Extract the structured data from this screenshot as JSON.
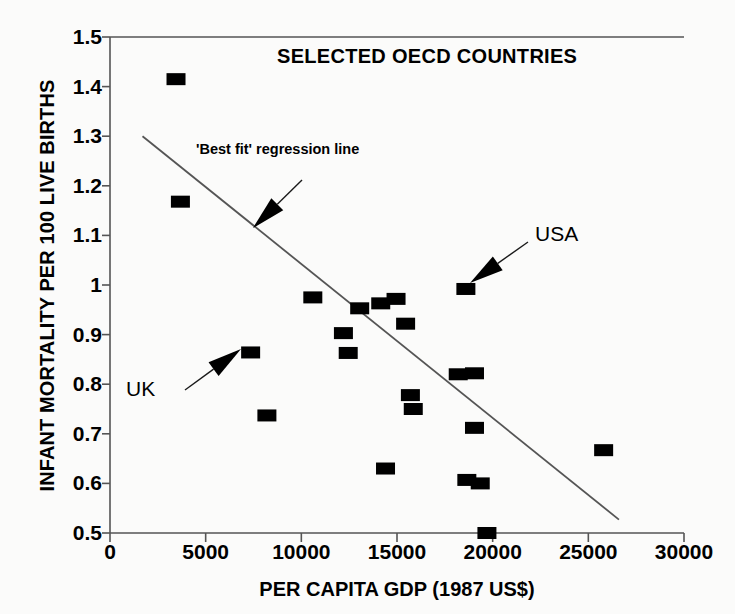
{
  "chart_data": {
    "type": "scatter",
    "title": "SELECTED OECD COUNTRIES",
    "xlabel": "PER CAPITA GDP (1987 US$)",
    "ylabel": "INFANT MORTALITY PER 100 LIVE BIRTHS",
    "xlim": [
      0,
      30000
    ],
    "ylim": [
      0.5,
      1.5
    ],
    "grid": false,
    "legend": "none",
    "xticks": [
      0,
      5000,
      10000,
      15000,
      20000,
      25000,
      30000
    ],
    "xtick_labels": [
      "0",
      "5000",
      "10000",
      "15000",
      "20000",
      "25000",
      "30000"
    ],
    "yticks": [
      0.5,
      0.6,
      0.7,
      0.8,
      0.9,
      1.0,
      1.1,
      1.2,
      1.3,
      1.4,
      1.5
    ],
    "ytick_labels": [
      "0.5",
      "0.6",
      "0.7",
      "0.8",
      "0.9",
      "1",
      "1.1",
      "1.2",
      "1.3",
      "1.4",
      "1.5"
    ],
    "marker": "filled-square",
    "marker_color": "#000000",
    "points": [
      {
        "x": 3450,
        "y": 1.415
      },
      {
        "x": 3680,
        "y": 1.168
      },
      {
        "x": 7350,
        "y": 0.864,
        "label": "UK"
      },
      {
        "x": 8200,
        "y": 0.737
      },
      {
        "x": 10600,
        "y": 0.975
      },
      {
        "x": 12200,
        "y": 0.903
      },
      {
        "x": 12450,
        "y": 0.863
      },
      {
        "x": 13050,
        "y": 0.953
      },
      {
        "x": 14150,
        "y": 0.963
      },
      {
        "x": 14400,
        "y": 0.63
      },
      {
        "x": 14950,
        "y": 0.972
      },
      {
        "x": 15450,
        "y": 0.922
      },
      {
        "x": 15700,
        "y": 0.778
      },
      {
        "x": 15850,
        "y": 0.75
      },
      {
        "x": 18200,
        "y": 0.82
      },
      {
        "x": 18600,
        "y": 0.992,
        "label": "USA"
      },
      {
        "x": 18650,
        "y": 0.607
      },
      {
        "x": 19050,
        "y": 0.822
      },
      {
        "x": 19350,
        "y": 0.6
      },
      {
        "x": 19050,
        "y": 0.712
      },
      {
        "x": 19700,
        "y": 0.5
      },
      {
        "x": 25800,
        "y": 0.667
      }
    ],
    "regression_line": {
      "label": "'Best fit' regression line",
      "x_start": 1700,
      "y_start": 1.3,
      "x_end": 26600,
      "y_end": 0.527,
      "color": "#555555"
    },
    "annotations": [
      {
        "name": "regression-annotation",
        "text": "'Best fit' regression line"
      },
      {
        "name": "usa-annotation",
        "text": "USA"
      },
      {
        "name": "uk-annotation",
        "text": "UK"
      }
    ]
  },
  "colors": {
    "marker": "#000000",
    "axis": "#555555",
    "background": "#fbfbfa",
    "text": "#000000"
  }
}
